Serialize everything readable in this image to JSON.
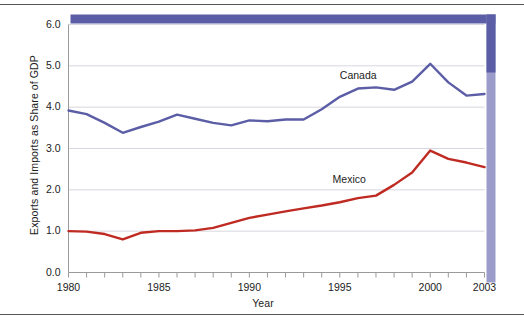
{
  "chart_data": {
    "type": "line",
    "title": "",
    "xlabel": "Year",
    "ylabel": "Exports and Imports as Share of GDP",
    "xlim": [
      1980,
      2003
    ],
    "ylim": [
      0.0,
      6.0
    ],
    "grid": true,
    "legend_position": "inline-annotations",
    "x": [
      1980,
      1981,
      1982,
      1983,
      1984,
      1985,
      1986,
      1987,
      1988,
      1989,
      1990,
      1991,
      1992,
      1993,
      1994,
      1995,
      1996,
      1997,
      1998,
      1999,
      2000,
      2001,
      2002,
      2003
    ],
    "xticks": [
      {
        "value": 1980,
        "label": "1980"
      },
      {
        "value": 1985,
        "label": "1985"
      },
      {
        "value": 1990,
        "label": "1990"
      },
      {
        "value": 1995,
        "label": "1995"
      },
      {
        "value": 2000,
        "label": "2000"
      },
      {
        "value": 2003,
        "label": "2003"
      }
    ],
    "yticks": [
      {
        "value": 0.0,
        "label": "0.0"
      },
      {
        "value": 1.0,
        "label": "1.0"
      },
      {
        "value": 2.0,
        "label": "2.0"
      },
      {
        "value": 3.0,
        "label": "3.0"
      },
      {
        "value": 4.0,
        "label": "4.0"
      },
      {
        "value": 5.0,
        "label": "5.0"
      },
      {
        "value": 6.0,
        "label": "6.0"
      }
    ],
    "series": [
      {
        "name": "Canada",
        "color": "#5b5ea6",
        "label_x": 1995.0,
        "label_y": 4.75,
        "values": [
          3.92,
          3.83,
          3.62,
          3.38,
          3.52,
          3.65,
          3.82,
          3.72,
          3.62,
          3.56,
          3.68,
          3.66,
          3.7,
          3.7,
          3.95,
          4.25,
          4.45,
          4.48,
          4.42,
          4.62,
          5.05,
          4.6,
          4.28,
          4.32
        ]
      },
      {
        "name": "Mexico",
        "color": "#bf2a22",
        "label_x": 1994.6,
        "label_y": 2.25,
        "values": [
          1.0,
          0.99,
          0.93,
          0.8,
          0.96,
          1.0,
          1.0,
          1.02,
          1.08,
          1.2,
          1.32,
          1.4,
          1.48,
          1.55,
          1.62,
          1.7,
          1.8,
          1.86,
          2.12,
          2.42,
          2.95,
          2.75,
          2.66,
          2.55
        ]
      }
    ],
    "frame": {
      "top_band_color": "#5b5ea6",
      "right_band_color": "#9b9cc9",
      "axis_color": "#9a9a9a",
      "gridline_color": "#d6d6de"
    }
  }
}
